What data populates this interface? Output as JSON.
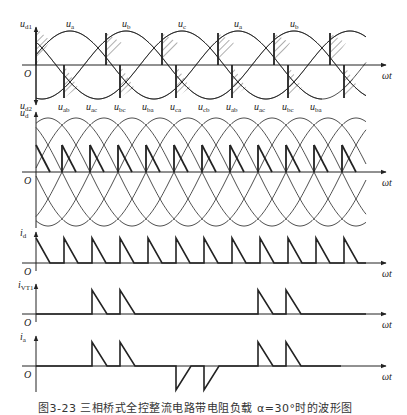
{
  "figure": {
    "caption": "图3-23  三相桥式全控整流电路带电阻负载 α=30°时的波形图",
    "geometry": {
      "origin_x": 36,
      "end_x": 366,
      "arrow_x": 386,
      "period_px": 168
    },
    "panels": [
      {
        "id": "phase-voltages",
        "y_axis_label_top": "u",
        "y_axis_label_top_sub": "d1",
        "y_axis_label_bottom": "u",
        "y_axis_label_bottom_sub": "d2",
        "origin_label": "O",
        "x_axis_label": "ωt",
        "axis_y": 65,
        "amplitude": 34,
        "curve_labels": [
          {
            "text": "u",
            "sub": "a",
            "x": 70
          },
          {
            "text": "u",
            "sub": "b",
            "x": 126
          },
          {
            "text": "u",
            "sub": "c",
            "x": 182
          },
          {
            "text": "u",
            "sub": "a",
            "x": 238
          },
          {
            "text": "u",
            "sub": "b",
            "x": 294
          }
        ]
      },
      {
        "id": "line-voltages",
        "y_axis_label": "u",
        "y_axis_label_sub": "d",
        "origin_label": "O",
        "x_axis_label": "ωt",
        "axis_y": 172,
        "amplitude": 54,
        "curve_labels": [
          {
            "text": "u",
            "sub": "ab",
            "x": 62
          },
          {
            "text": "u",
            "sub": "ac",
            "x": 90
          },
          {
            "text": "u",
            "sub": "bc",
            "x": 118
          },
          {
            "text": "u",
            "sub": "ba",
            "x": 146
          },
          {
            "text": "u",
            "sub": "ca",
            "x": 174
          },
          {
            "text": "u",
            "sub": "cb",
            "x": 202
          },
          {
            "text": "u",
            "sub": "ab",
            "x": 230
          },
          {
            "text": "u",
            "sub": "ac",
            "x": 258
          },
          {
            "text": "u",
            "sub": "bc",
            "x": 286
          },
          {
            "text": "u",
            "sub": "ba",
            "x": 314
          }
        ]
      },
      {
        "id": "load-current",
        "y_axis_label": "i",
        "y_axis_label_sub": "d",
        "origin_label": "O",
        "x_axis_label": "ωt",
        "axis_y": 263,
        "pulse_height": 25
      },
      {
        "id": "thyristor-current",
        "y_axis_label": "i",
        "y_axis_label_sub": "VT1",
        "origin_label": "O",
        "x_axis_label": "ωt",
        "axis_y": 314,
        "pulse_height": 24,
        "pulse_starts_x": [
          92,
          120,
          258,
          286
        ]
      },
      {
        "id": "phase-a-current",
        "y_axis_label": "i",
        "y_axis_label_sub": "a",
        "origin_label": "O",
        "x_axis_label": "ωt",
        "axis_y": 366,
        "pulse_height": 24,
        "positive_pulse_starts_x": [
          92,
          120,
          258,
          286
        ],
        "negative_pulse_starts_x": [
          176,
          204
        ]
      }
    ]
  }
}
